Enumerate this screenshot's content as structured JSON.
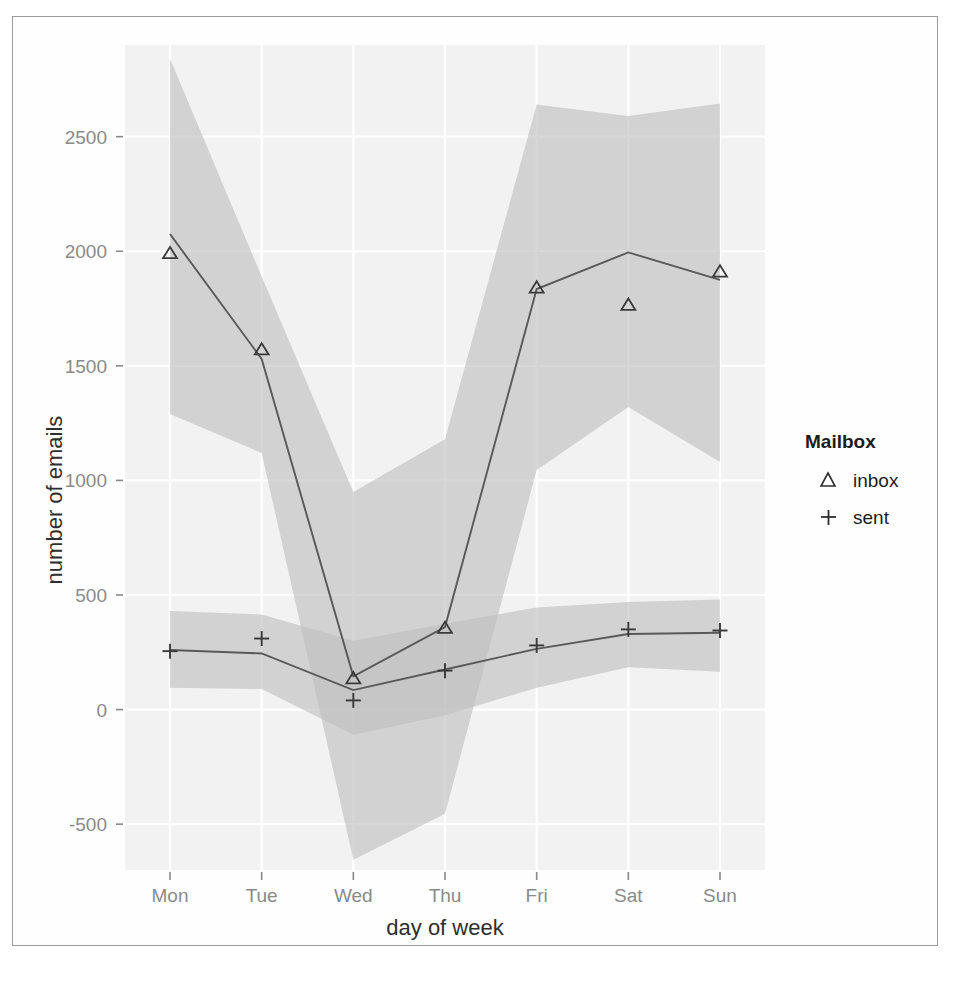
{
  "chart_data": {
    "type": "line",
    "title": "",
    "xlabel": "day of week",
    "ylabel": "number of emails",
    "categories": [
      "Mon",
      "Tue",
      "Wed",
      "Thu",
      "Fri",
      "Sat",
      "Sun"
    ],
    "ylim": [
      -700,
      2900
    ],
    "yticks": [
      -500,
      0,
      500,
      1000,
      1500,
      2000,
      2500
    ],
    "ytick_labels": [
      "-500",
      "0",
      "500",
      "1000",
      "1500",
      "2000",
      "2500"
    ],
    "grid": true,
    "legend_position": "right",
    "legend_title": "Mailbox",
    "series": [
      {
        "name": "inbox",
        "marker": "triangle",
        "points": [
          1990,
          1570,
          135,
          355,
          1840,
          1765,
          1910
        ],
        "fit": [
          2075,
          1530,
          145,
          360,
          1835,
          1995,
          1875
        ],
        "band_upper": [
          2840,
          1890,
          950,
          1180,
          2640,
          2590,
          2645
        ],
        "band_lower": [
          1290,
          1120,
          -655,
          -455,
          1045,
          1320,
          1080
        ]
      },
      {
        "name": "sent",
        "marker": "plus",
        "points": [
          255,
          310,
          40,
          170,
          280,
          350,
          345
        ],
        "fit": [
          260,
          245,
          85,
          175,
          265,
          330,
          335
        ],
        "band_upper": [
          430,
          415,
          300,
          375,
          445,
          470,
          480
        ],
        "band_lower": [
          95,
          90,
          -110,
          -25,
          95,
          185,
          165
        ]
      }
    ]
  },
  "legend": {
    "title": "Mailbox",
    "entries": [
      {
        "label": "inbox",
        "glyph": "triangle-icon"
      },
      {
        "label": "sent",
        "glyph": "plus-icon"
      }
    ]
  },
  "axes": {
    "x_title": "day of week",
    "y_title": "number of emails",
    "x_ticks": [
      "Mon",
      "Tue",
      "Wed",
      "Thu",
      "Fri",
      "Sat",
      "Sun"
    ],
    "y_ticks": [
      "2500",
      "2000",
      "1500",
      "1000",
      "500",
      "0",
      "-500"
    ]
  },
  "colors": {
    "panel_background": "#f2f2f2",
    "gridline": "#ffffff",
    "line": "#595959",
    "band": "#bfbfbf",
    "tick_text": "#8a8a8a",
    "title_text": "#2e2e2e",
    "frame": "#9a9a9a"
  }
}
